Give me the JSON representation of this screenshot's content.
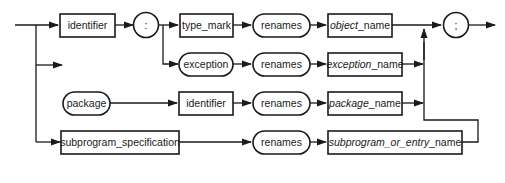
{
  "diagram": {
    "type": "syntax-railroad-diagram",
    "nodes": {
      "identifier_1": {
        "label": "identifier",
        "shape": "rectangle"
      },
      "colon": {
        "label": ":",
        "shape": "circle"
      },
      "type_mark": {
        "label": "type_mark",
        "shape": "rectangle"
      },
      "exception": {
        "label": "exception",
        "shape": "rounded"
      },
      "renames_1": {
        "label": "renames",
        "shape": "rounded"
      },
      "renames_2": {
        "label": "renames",
        "shape": "rounded"
      },
      "renames_3": {
        "label": "renames",
        "shape": "rounded"
      },
      "renames_4": {
        "label": "renames",
        "shape": "rounded"
      },
      "object_name": {
        "italic": "object",
        "suffix": "_name",
        "shape": "rectangle"
      },
      "exception_name": {
        "italic": "exception",
        "suffix": "_name",
        "shape": "rectangle"
      },
      "package": {
        "label": "package",
        "shape": "rounded"
      },
      "identifier_2": {
        "label": "identifier",
        "shape": "rectangle"
      },
      "package_name": {
        "italic": "package",
        "suffix": "_name",
        "shape": "rectangle"
      },
      "subprogram_specification": {
        "label": "subprogram_specification",
        "shape": "rectangle"
      },
      "subprogram_or_entry_name": {
        "italic": "subprogram_or_entry",
        "suffix": "_name",
        "shape": "rectangle"
      },
      "semicolon": {
        "label": ";",
        "shape": "circle"
      }
    },
    "paths": [
      [
        "identifier",
        ":",
        "type_mark",
        "renames",
        "object_name",
        ";"
      ],
      [
        "identifier",
        ":",
        "exception",
        "renames",
        "exception_name",
        ";"
      ],
      [
        "package",
        "identifier",
        "renames",
        "package_name",
        ";"
      ],
      [
        "subprogram_specification",
        "renames",
        "subprogram_or_entry_name",
        ";"
      ]
    ],
    "colors": {
      "ink": "#1a1a1a",
      "background": "#ffffff"
    }
  }
}
